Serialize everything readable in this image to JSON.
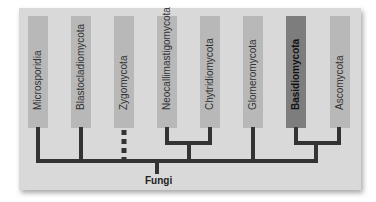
{
  "diagram": {
    "type": "phylogenetic-tree",
    "root": "Fungi",
    "colors": {
      "panel": "#d9d9d9",
      "bar": "#b8b8b8",
      "bar_highlight": "#7d7d7d",
      "lines": "#333333"
    },
    "taxa": [
      {
        "name": "Microsporidia",
        "highlight": false
      },
      {
        "name": "Blastocladiomycota",
        "highlight": false
      },
      {
        "name": "Zygomycota",
        "highlight": false,
        "dashed_branch": true
      },
      {
        "name": "Neocallimastigomycota",
        "highlight": false
      },
      {
        "name": "Chytridiomycota",
        "highlight": false
      },
      {
        "name": "Glomeromycota",
        "highlight": false
      },
      {
        "name": "Basidiomycota",
        "highlight": true
      },
      {
        "name": "Ascomycota",
        "highlight": false
      }
    ]
  }
}
